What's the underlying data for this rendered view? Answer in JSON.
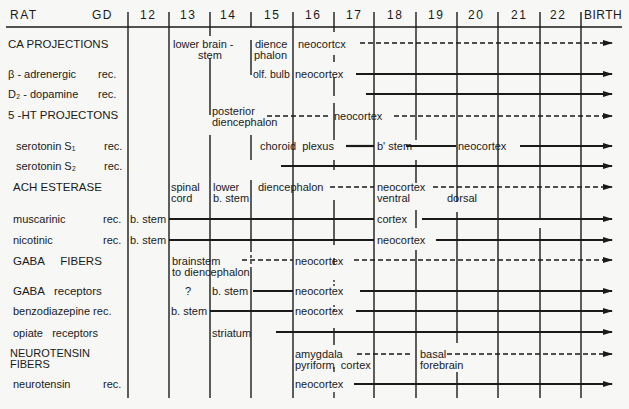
{
  "header": {
    "rat_label": "RAT",
    "gd_label": "GD",
    "days": [
      "12",
      "13",
      "14",
      "15",
      "16",
      "17",
      "18",
      "19",
      "20",
      "21",
      "22"
    ],
    "birth_label": "BIRTH"
  },
  "rows": [
    {
      "label": "CA PROJECTIONS",
      "suffix": "",
      "annotations": [
        "lower brain -",
        "stem",
        "dience",
        "phalon",
        "neocortcx"
      ]
    },
    {
      "label": "β - adrenergic",
      "suffix": "rec.",
      "annotations": [
        "olf. bulb",
        "neocortex"
      ]
    },
    {
      "label": "D₂ - dopamine",
      "suffix": "rec.",
      "annotations": []
    },
    {
      "label": "5 -HT PROJECTONS",
      "suffix": "",
      "annotations": [
        "posterior",
        "diencephalon",
        "neocortex"
      ]
    },
    {
      "label": "serotonin S₁",
      "suffix": "rec.",
      "annotations": [
        "choroid  plexus",
        "b' stem",
        "neocortex"
      ]
    },
    {
      "label": "serotonin S₂",
      "suffix": "rec.",
      "annotations": []
    },
    {
      "label": "ACH  ESTERASE",
      "suffix": "",
      "annotations": [
        "spinal",
        "cord",
        "lower",
        "b. stem",
        "diencephalon",
        "neocortex",
        "ventral",
        "dorsal"
      ]
    },
    {
      "label": "muscarinic",
      "suffix": "rec.",
      "annotations": [
        "b. stem",
        "cortex"
      ]
    },
    {
      "label": "nicotinic",
      "suffix": "rec.",
      "annotations": [
        "b. stem",
        "neocortex"
      ]
    },
    {
      "label": "GABA     FIBERS",
      "suffix": "",
      "annotations": [
        "brainstem",
        "to diencephalon",
        "neocortex"
      ]
    },
    {
      "label": "GABA   receptors",
      "suffix": "",
      "annotations": [
        "?",
        "b. stem",
        "neocortex"
      ]
    },
    {
      "label": "benzodiazepine rec.",
      "suffix": "",
      "annotations": [
        "b. stem",
        "neocortex"
      ]
    },
    {
      "label": "opiate   receptors",
      "suffix": "",
      "annotations": [
        "striatum"
      ]
    },
    {
      "label": "NEUROTENSIN",
      "label2": "FIBERS",
      "suffix": "",
      "annotations": [
        "amygdala",
        "pyriform  cortex",
        "basal",
        "forebrain"
      ]
    },
    {
      "label": "neurotensin",
      "suffix": "rec.",
      "annotations": [
        "neocortex"
      ]
    }
  ],
  "colors": {
    "ink": "#1a1a1a",
    "paper": "#f7f7f5"
  }
}
